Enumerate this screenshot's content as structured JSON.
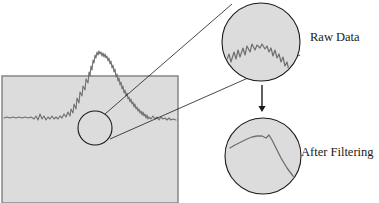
{
  "figure": {
    "background_color": "#ffffff",
    "panel_fill": "#dcdcdc",
    "panel_stroke": "#8c8c8c",
    "trace_color": "#6f6f6f",
    "leader_color": "#1a1a1a",
    "arrow_color": "#1a1a1a",
    "label_color": "#1a1a1a"
  },
  "main_plot": {
    "name": "spectrum-panel",
    "x": 2,
    "y": 76,
    "width": 176,
    "height": 127
  },
  "zoom_marker": {
    "name": "zoom-circle-marker",
    "cx": 95,
    "cy": 128,
    "r": 17
  },
  "raw_circle": {
    "label": "Raw Data",
    "cx": 261,
    "cy": 42,
    "r": 39,
    "label_x": 310,
    "label_y": 38
  },
  "filtered_circle": {
    "label": "After Filtering",
    "cx": 263,
    "cy": 156,
    "r": 38,
    "label_x": 301,
    "label_y": 153
  },
  "arrow": {
    "name": "downward-arrow",
    "x": 262,
    "y_start": 85,
    "y_end": 112
  },
  "leader_lines": [
    {
      "x1": 105,
      "y1": 114,
      "x2": 232,
      "y2": 4
    },
    {
      "x1": 110,
      "y1": 139,
      "x2": 300,
      "y2": 55
    }
  ],
  "chart_data": {
    "type": "line",
    "xlabel": "",
    "ylabel": "",
    "grid": false,
    "legend": "none",
    "xlim": [
      0,
      176
    ],
    "ylim": [
      0,
      127
    ],
    "series": [
      {
        "name": "raw-spectrum",
        "description": "Noisy baseline, rising edge to a noisy peak, then falling edge back to a noisy baseline",
        "points": "4,118 7,117 10,118 13,117 16,118 19,117 22,118 25,117 28,118 31,117 34,119 36,116 38,120 40,114 42,119 44,116 46,120 48,117 50,119 52,116 54,119 56,117 58,119 60,116 62,118 64,114 66,117 68,112 70,116 71,109 73,113 74,104 76,109 77,98 79,103 80,92 82,96 83,86 85,90 86,79 88,83 89,72 90,76 91,66 92,70 93,60 94,63 95,55 96,58 97,52 98,55 99,51 100,54 101,52 102,56 103,53 104,57 105,54 106,58 107,56 108,61 109,58 110,64 111,61 112,68 113,65 114,72 115,69 116,77 117,74 118,81 119,78 120,85 121,82 122,89 123,86 124,93 125,90 126,96 127,93 128,99 129,97 130,102 131,99 132,104 133,102 134,107 135,104 136,109 137,107 138,111 139,109 140,113 141,111 142,115 143,112 144,116 145,114 146,118 147,115 148,119 149,117 151,119 153,116 155,119 157,117 159,120 161,117 163,119 165,118 167,120 169,118 171,120 173,119 176,120"
      }
    ],
    "insets": [
      {
        "name": "raw-data-inset",
        "label": "Raw Data",
        "description": "Magnified jagged noisy trace descending left to right",
        "points": "226,62 229,54 231,62 234,52 236,59 238,50 240,57 243,48 245,55 247,46 250,52 252,44 255,50 257,45 260,48 262,44 265,49 267,46 269,52 271,48 273,56 275,50 277,58 279,54 281,62 283,57 285,66 287,62 289,71 291,66 293,74 295,70 297,77"
      },
      {
        "name": "after-filtering-inset",
        "label": "After Filtering",
        "description": "Magnified smoothed trace with a plateau then a steady descent",
        "points": "230,148 235,145 241,142 247,139 252,137 257,136 262,136 266,138 269,135 272,140 275,146 278,152 281,158 284,163 287,168 290,172 293,176 296,179 300,181"
      }
    ]
  }
}
